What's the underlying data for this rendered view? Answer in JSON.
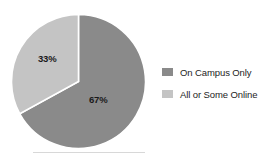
{
  "chart_data": {
    "type": "pie",
    "title": "",
    "subtitle": "",
    "xlabel": "",
    "ylabel": "",
    "grid": false,
    "legend_position": "right",
    "start_angle_deg": 0,
    "direction": "clockwise",
    "categories": [
      "On Campus Only",
      "All or Some Online"
    ],
    "values": [
      67,
      33
    ],
    "value_unit": "%",
    "slices": [
      {
        "label": "On Campus Only",
        "value": 67,
        "data_label": "67%",
        "color": "#8a8a8a",
        "start_angle_deg": 0,
        "end_angle_deg": 241.2
      },
      {
        "label": "All or Some Online",
        "value": 33,
        "data_label": "33%",
        "color": "#c4c4c4",
        "start_angle_deg": 241.2,
        "end_angle_deg": 360
      }
    ],
    "annotations": []
  },
  "legend": {
    "items": [
      {
        "label": "On Campus Only",
        "color": "#8a8a8a",
        "swatch_name": "legend-swatch-on-campus-only"
      },
      {
        "label": "All or Some Online",
        "color": "#c4c4c4",
        "swatch_name": "legend-swatch-all-or-some-online"
      }
    ]
  },
  "style": {
    "background": "#ffffff",
    "slice_divider_color": "#ffffff",
    "label_color": "#1a1a1a",
    "rule_color": "#d8d8d8"
  }
}
